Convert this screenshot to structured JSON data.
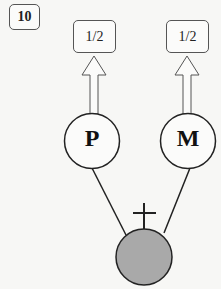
{
  "figure_number": "10",
  "parents": [
    {
      "id": "P",
      "label": "P",
      "allele_fraction": "1/2"
    },
    {
      "id": "M",
      "label": "M",
      "allele_fraction": "1/2"
    }
  ],
  "child": {
    "status": "deceased",
    "marker": "cross",
    "fill_color": "#a9a9a9"
  },
  "colors": {
    "stroke": "#222222",
    "background": "#f7f7f5"
  }
}
